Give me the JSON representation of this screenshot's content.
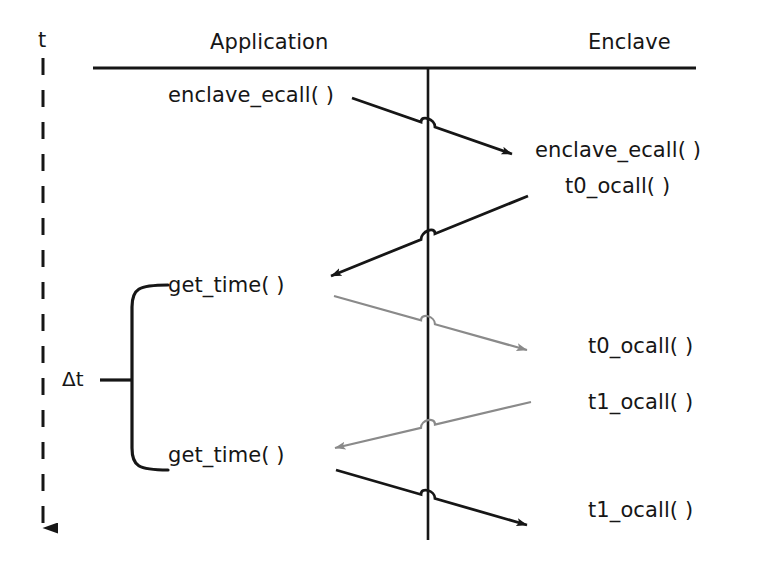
{
  "diagram": {
    "title_axis_label": "t",
    "duration_label": "Δt",
    "columns": [
      {
        "id": "application",
        "label": "Application",
        "x": 210,
        "y": 32
      },
      {
        "id": "enclave",
        "label": "Enclave",
        "x": 588,
        "y": 32
      }
    ],
    "left_messages": [
      {
        "id": "app-enclave-ecall",
        "label": "enclave_ecall( )",
        "x": 168,
        "y": 85
      },
      {
        "id": "app-get-time-0",
        "label": "get_time( )",
        "x": 168,
        "y": 275
      },
      {
        "id": "app-get-time-1",
        "label": "get_time( )",
        "x": 168,
        "y": 445
      }
    ],
    "right_messages": [
      {
        "id": "enc-enclave-ecall",
        "label": "enclave_ecall( )",
        "x": 535,
        "y": 140
      },
      {
        "id": "enc-t0-ocall-entry",
        "label": "t0_ocall( )",
        "x": 565,
        "y": 176
      },
      {
        "id": "enc-t0-ocall-return",
        "label": "t0_ocall( )",
        "x": 588,
        "y": 336
      },
      {
        "id": "enc-t1-ocall-entry",
        "label": "t1_ocall( )",
        "x": 588,
        "y": 392
      },
      {
        "id": "enc-t1-ocall-return",
        "label": "t1_ocall( )",
        "x": 588,
        "y": 500
      }
    ],
    "arrows": [
      {
        "id": "arrow-enclave-ecall-call",
        "direction": "right",
        "color": "#161616",
        "from": [
          352,
          98
        ],
        "to": [
          512,
          154
        ]
      },
      {
        "id": "arrow-t0-ocall-out",
        "direction": "left",
        "color": "#161616",
        "from": [
          528,
          196
        ],
        "to": [
          331,
          276
        ]
      },
      {
        "id": "arrow-t0-ocall-return",
        "direction": "right",
        "color": "#8a8a8a",
        "from": [
          334,
          296
        ],
        "to": [
          527,
          350
        ]
      },
      {
        "id": "arrow-t1-ocall-out",
        "direction": "left",
        "color": "#8a8a8a",
        "from": [
          531,
          402
        ],
        "to": [
          335,
          448
        ]
      },
      {
        "id": "arrow-t1-ocall-return",
        "direction": "right",
        "color": "#161616",
        "from": [
          336,
          470
        ],
        "to": [
          527,
          525
        ]
      }
    ],
    "geometry": {
      "time_axis_x": 43,
      "time_axis_top": 58,
      "time_axis_bottom": 545,
      "header_rule_y": 68,
      "header_rule_x0": 93,
      "header_rule_x1": 696,
      "lifeline_x": 428,
      "lifeline_top": 68,
      "lifeline_bottom": 540,
      "brace_x": 132,
      "brace_top": 285,
      "brace_bottom": 470,
      "brace_tick_y": 380,
      "brace_tick_x": 100
    },
    "colors": {
      "ink": "#161616",
      "gray_arrow": "#8a8a8a",
      "background": "#ffffff"
    }
  }
}
